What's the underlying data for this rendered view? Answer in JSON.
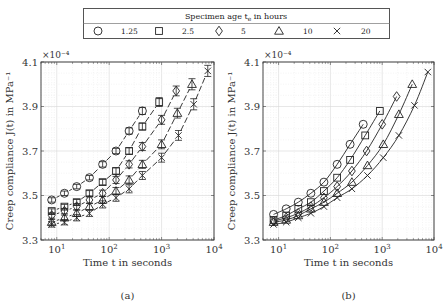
{
  "legend": {
    "title": "Specimen age t",
    "title_sub": "e",
    "title_suffix": " in hours",
    "entries": [
      {
        "marker": "circle",
        "label": "1.25"
      },
      {
        "marker": "square",
        "label": "2.5"
      },
      {
        "marker": "diamond",
        "label": "5"
      },
      {
        "marker": "triangle",
        "label": "10"
      },
      {
        "marker": "cross",
        "label": "20"
      }
    ]
  },
  "panels": [
    {
      "caption": "(a)",
      "xlabel": "Time t in seconds",
      "ylabel": "Creep compliance J(t) in MPa⁻¹",
      "multiplier": "×10⁻⁴"
    },
    {
      "caption": "(b)",
      "xlabel": "Time t in seconds",
      "ylabel": "Creep compliance J(t) in MPa⁻¹",
      "multiplier": "×10⁻⁴"
    }
  ],
  "chart_data": [
    {
      "type": "scatter",
      "title": "(a)",
      "xlabel": "Time t in seconds",
      "ylabel": "Creep compliance J(t) in MPa^-1",
      "xscale": "log",
      "xlim": [
        5,
        10000
      ],
      "ylim": [
        3.3,
        4.1
      ],
      "y_multiplier": "1e-4",
      "xticks": [
        "10^1",
        "10^2",
        "10^3",
        "10^4"
      ],
      "yticks": [
        3.3,
        3.5,
        3.7,
        3.9,
        4.1
      ],
      "grid": true,
      "line_style": "dashed",
      "error_bars": true,
      "series": [
        {
          "name": "1.25",
          "marker": "circle",
          "x": [
            8,
            14,
            24,
            42,
            75,
            135,
            240,
            430
          ],
          "y": [
            3.48,
            3.51,
            3.54,
            3.58,
            3.64,
            3.7,
            3.79,
            3.88
          ],
          "err": [
            0.01,
            0.01,
            0.01,
            0.01,
            0.012,
            0.012,
            0.014,
            0.016
          ]
        },
        {
          "name": "2.5",
          "marker": "square",
          "x": [
            8,
            14,
            24,
            42,
            75,
            135,
            240,
            430,
            900
          ],
          "y": [
            3.43,
            3.45,
            3.47,
            3.51,
            3.56,
            3.61,
            3.7,
            3.81,
            3.92
          ],
          "err": [
            0.01,
            0.01,
            0.012,
            0.012,
            0.012,
            0.014,
            0.014,
            0.016,
            0.02
          ]
        },
        {
          "name": "5",
          "marker": "diamond",
          "x": [
            8,
            14,
            24,
            42,
            75,
            135,
            240,
            430,
            1000,
            1900
          ],
          "y": [
            3.41,
            3.43,
            3.45,
            3.48,
            3.51,
            3.57,
            3.64,
            3.72,
            3.84,
            3.97
          ],
          "err": [
            0.012,
            0.012,
            0.014,
            0.014,
            0.014,
            0.016,
            0.016,
            0.018,
            0.02,
            0.022
          ]
        },
        {
          "name": "10",
          "marker": "triangle",
          "x": [
            8,
            14,
            24,
            42,
            75,
            135,
            240,
            430,
            1000,
            2000,
            3800
          ],
          "y": [
            3.38,
            3.4,
            3.42,
            3.45,
            3.48,
            3.52,
            3.57,
            3.64,
            3.73,
            3.87,
            4.0
          ],
          "err": [
            0.012,
            0.012,
            0.014,
            0.014,
            0.016,
            0.016,
            0.018,
            0.018,
            0.02,
            0.022,
            0.025
          ]
        },
        {
          "name": "20",
          "marker": "cross",
          "x": [
            8,
            14,
            24,
            42,
            75,
            135,
            240,
            430,
            1000,
            2100,
            4100,
            7600
          ],
          "y": [
            3.37,
            3.38,
            3.4,
            3.42,
            3.46,
            3.49,
            3.53,
            3.59,
            3.67,
            3.77,
            3.91,
            4.06
          ],
          "err": [
            0.012,
            0.012,
            0.014,
            0.014,
            0.016,
            0.016,
            0.018,
            0.018,
            0.02,
            0.022,
            0.025,
            0.025
          ]
        }
      ]
    },
    {
      "type": "scatter",
      "title": "(b)",
      "xlabel": "Time t in seconds",
      "ylabel": "Creep compliance J(t) in MPa^-1",
      "xscale": "log",
      "xlim": [
        5,
        10000
      ],
      "ylim": [
        3.3,
        4.1
      ],
      "y_multiplier": "1e-4",
      "xticks": [
        "10^1",
        "10^2",
        "10^3",
        "10^4"
      ],
      "yticks": [
        3.3,
        3.5,
        3.7,
        3.9,
        4.1
      ],
      "grid": true,
      "line_style": "solid (model fit)",
      "series": [
        {
          "name": "1.25",
          "marker": "circle",
          "x": [
            8,
            14,
            24,
            42,
            75,
            135,
            240,
            430
          ],
          "y": [
            3.415,
            3.44,
            3.47,
            3.51,
            3.56,
            3.64,
            3.73,
            3.82
          ]
        },
        {
          "name": "2.5",
          "marker": "square",
          "x": [
            8,
            14,
            24,
            42,
            75,
            135,
            240,
            470,
            900
          ],
          "y": [
            3.39,
            3.41,
            3.44,
            3.47,
            3.52,
            3.58,
            3.66,
            3.77,
            3.88
          ]
        },
        {
          "name": "5",
          "marker": "diamond",
          "x": [
            8,
            14,
            24,
            42,
            75,
            135,
            260,
            500,
            1000,
            1900
          ],
          "y": [
            3.385,
            3.4,
            3.42,
            3.45,
            3.49,
            3.54,
            3.61,
            3.7,
            3.82,
            3.945
          ]
        },
        {
          "name": "10",
          "marker": "triangle",
          "x": [
            8,
            14,
            24,
            42,
            75,
            135,
            260,
            520,
            1050,
            2100,
            3800
          ],
          "y": [
            3.38,
            3.39,
            3.41,
            3.44,
            3.47,
            3.51,
            3.56,
            3.635,
            3.73,
            3.865,
            4.0
          ]
        },
        {
          "name": "20",
          "marker": "cross",
          "x": [
            8,
            14,
            24,
            42,
            75,
            135,
            260,
            520,
            1050,
            2100,
            4200,
            7600
          ],
          "y": [
            3.37,
            3.38,
            3.4,
            3.42,
            3.45,
            3.49,
            3.53,
            3.59,
            3.67,
            3.77,
            3.905,
            4.055
          ]
        }
      ]
    }
  ]
}
